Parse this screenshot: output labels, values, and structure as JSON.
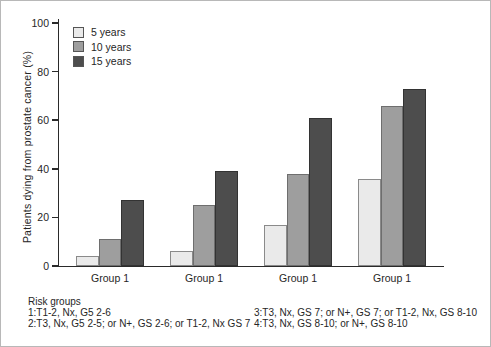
{
  "figure": {
    "background": "#ffffff",
    "border_color": "#b8b8b8",
    "text_color": "#262626",
    "axis_color": "#2a2a2a"
  },
  "chart_data": {
    "type": "bar",
    "title": "",
    "xlabel": "",
    "ylabel": "Patients dying from prostate cancer (%)",
    "categories": [
      "Group 1",
      "Group 1",
      "Group 1",
      "Group 1"
    ],
    "series": [
      {
        "name": "5 years",
        "color": "#eaeaea",
        "border": "#8a8a8a",
        "values": [
          4,
          6,
          17,
          36
        ]
      },
      {
        "name": "10 years",
        "color": "#9e9e9e",
        "border": "#6e6e6e",
        "values": [
          11,
          25,
          38,
          66
        ]
      },
      {
        "name": "15 years",
        "color": "#4d4d4d",
        "border": "#333333",
        "values": [
          27,
          39,
          61,
          73
        ]
      }
    ],
    "ylim": [
      0,
      100
    ],
    "yticks": [
      0,
      20,
      40,
      60,
      80,
      100
    ],
    "grid": false,
    "legend_position": "top-left"
  },
  "footnote": {
    "title": "Risk groups",
    "left_lines": [
      "1:T1-2, Nx, G5 2-6",
      "2:T3, Nx, G5 2-5; or N+, GS 2-6; or T1-2, Nx GS 7"
    ],
    "right_lines": [
      "3:T3, Nx, GS 7; or N+, GS 7; or T1-2, Nx, GS 8-10",
      "4:T3, Nx, GS 8-10; or N+, GS 8-10"
    ]
  }
}
